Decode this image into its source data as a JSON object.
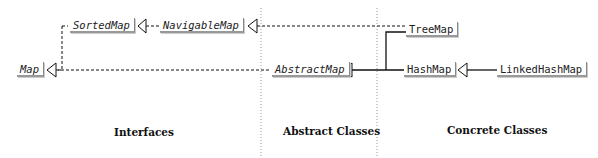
{
  "nodes": {
    "map": "Map",
    "sorted_map": "SortedMap",
    "navigable_map": "NavigableMap",
    "abstract_map": "AbstractMap",
    "tree_map": "TreeMap",
    "hash_map": "HashMap",
    "linked_hash_map": "LinkedHashMap"
  },
  "sections": {
    "interfaces": "Interfaces",
    "abstract_classes": "Abstract Classes",
    "concrete_classes": "Concrete Classes"
  },
  "colors": {
    "line": "#111111",
    "divider": "#999999",
    "box_border": "#888888"
  }
}
